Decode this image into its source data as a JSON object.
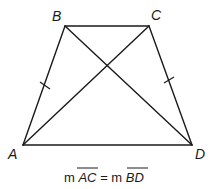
{
  "figure": {
    "type": "isosceles-trapezoid",
    "vertices": {
      "A": {
        "label": "A"
      },
      "B": {
        "label": "B"
      },
      "C": {
        "label": "C"
      },
      "D": {
        "label": "D"
      }
    },
    "sides": [
      "AB",
      "BC",
      "CD",
      "DA"
    ],
    "diagonals": [
      "AC",
      "BD"
    ],
    "congruent_marks": [
      "AB",
      "CD"
    ],
    "caption": {
      "prefix1": "m ",
      "seg1": "AC",
      "equals": " = ",
      "prefix2": "m ",
      "seg2": "BD"
    }
  }
}
